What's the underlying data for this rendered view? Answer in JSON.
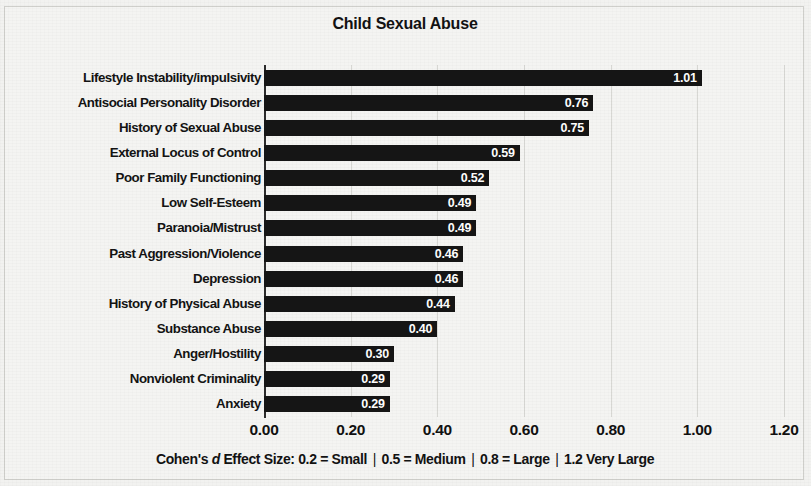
{
  "chart_data": {
    "type": "bar",
    "orientation": "horizontal",
    "title": "Child Sexual Abuse",
    "xlabel": "",
    "ylabel": "",
    "xlim": [
      0.0,
      1.2
    ],
    "xticks": [
      "0.00",
      "0.20",
      "0.40",
      "0.60",
      "0.80",
      "1.00",
      "1.20"
    ],
    "xtick_values": [
      0.0,
      0.2,
      0.4,
      0.6,
      0.8,
      1.0,
      1.2
    ],
    "grid": true,
    "grid_axis": "x",
    "legend": null,
    "bar_color": "#151515",
    "value_label_color": "#ffffff",
    "categories": [
      "Lifestyle Instability/impulsivity",
      "Antisocial Personality Disorder",
      "History of Sexual Abuse",
      "External Locus of Control",
      "Poor Family Functioning",
      "Low Self-Esteem",
      "Paranoia/Mistrust",
      "Past Aggression/Violence",
      "Depression",
      "History of Physical Abuse",
      "Substance Abuse",
      "Anger/Hostility",
      "Nonviolent Criminality",
      "Anxiety"
    ],
    "values": [
      1.01,
      0.76,
      0.75,
      0.59,
      0.52,
      0.49,
      0.49,
      0.46,
      0.46,
      0.44,
      0.4,
      0.3,
      0.29,
      0.29
    ],
    "value_labels": [
      "1.01",
      "0.76",
      "0.75",
      "0.59",
      "0.52",
      "0.49",
      "0.49",
      "0.46",
      "0.46",
      "0.44",
      "0.40",
      "0.30",
      "0.29",
      "0.29"
    ]
  },
  "footer": {
    "prefix": "Cohen's ",
    "italic_symbol": "d",
    "segment_1": " Effect Size: 0.2 = Small",
    "separator": "|",
    "segment_2": "0.5 = Medium",
    "segment_3": "0.8 = Large",
    "segment_4": "1.2 Very Large"
  }
}
